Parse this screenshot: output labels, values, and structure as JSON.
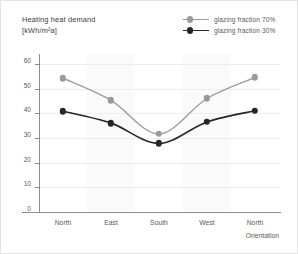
{
  "chart_data": {
    "type": "line",
    "title": "Heating heat demand",
    "title_unit": "[kWh/m²a]",
    "xlabel": "Orientation",
    "ylabel": "Heating heat demand [kWh/m²a]",
    "categories": [
      "North",
      "East",
      "South",
      "West",
      "North"
    ],
    "yticks": [
      0,
      10,
      20,
      30,
      40,
      50,
      60
    ],
    "ylim": [
      0,
      64
    ],
    "grid": "horizontal",
    "legend_position": "top-right",
    "series": [
      {
        "name": "glazing fraction 70%",
        "color": "#9a9a9a",
        "values": [
          54.2,
          45.2,
          31.6,
          46.0,
          54.5
        ]
      },
      {
        "name": "glazing fraction 30%",
        "color": "#262626",
        "values": [
          40.8,
          36.0,
          27.8,
          36.5,
          41.0
        ]
      }
    ]
  },
  "legend": {
    "items": [
      {
        "label": "glazing fraction 70%",
        "color": "#9a9a9a"
      },
      {
        "label": "glazing fraction 30%",
        "color": "#262626"
      }
    ]
  },
  "axes": {
    "y_tick_labels": [
      "60",
      "50",
      "40",
      "30",
      "20",
      "10",
      "0"
    ],
    "x_tick_labels": [
      "North",
      "East",
      "South",
      "West",
      "North"
    ],
    "x_axis_title": "Orientation"
  }
}
